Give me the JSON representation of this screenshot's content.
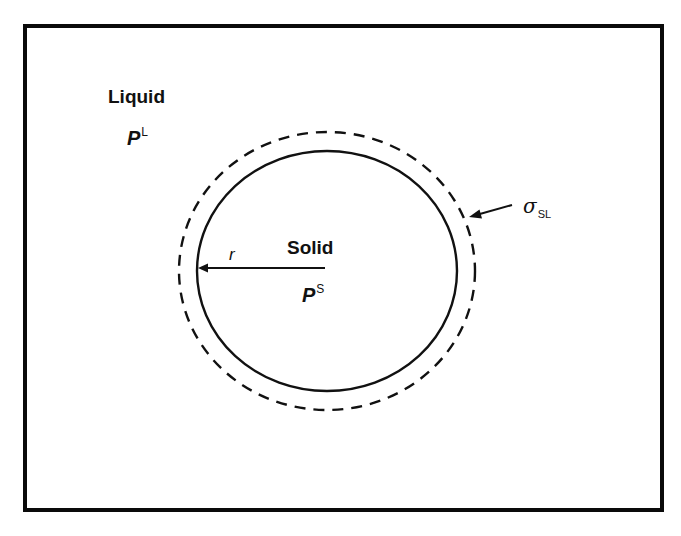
{
  "diagram": {
    "type": "schematic",
    "regions": {
      "outer": {
        "label": "Liquid",
        "pressure_symbol": "P",
        "pressure_superscript": "L"
      },
      "inner": {
        "label": "Solid",
        "pressure_symbol": "P",
        "pressure_superscript": "S"
      }
    },
    "radius": {
      "label": "r"
    },
    "interface": {
      "symbol": "σ",
      "subscript": "SL"
    },
    "colors": {
      "stroke": "#111111",
      "background": "#ffffff"
    }
  }
}
